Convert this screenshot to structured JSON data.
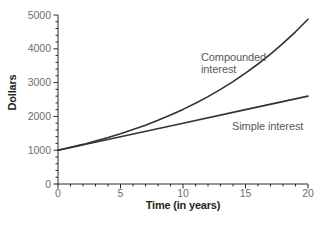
{
  "chart_data": {
    "type": "line",
    "title": "",
    "xlabel": "Time (in years)",
    "ylabel": "Dollars",
    "xlim": [
      0,
      20
    ],
    "ylim": [
      0,
      5000
    ],
    "grid": false,
    "legend_position": "none (inline annotations)",
    "x_axis": {
      "major_ticks": [
        0,
        5,
        10,
        15,
        20
      ],
      "minor_tick_step": 1
    },
    "y_axis": {
      "major_ticks": [
        0,
        1000,
        2000,
        3000,
        4000,
        5000
      ],
      "minor_tick_step": 200
    },
    "series": [
      {
        "name": "Compounded interest",
        "slug": "compounded-interest",
        "x": [
          0,
          1,
          2,
          3,
          4,
          5,
          6,
          7,
          8,
          9,
          10,
          11,
          12,
          13,
          14,
          15,
          16,
          17,
          18,
          19,
          20
        ],
        "values": [
          1000,
          1082,
          1172,
          1268,
          1373,
          1486,
          1608,
          1741,
          1885,
          2040,
          2208,
          2390,
          2587,
          2800,
          3031,
          3281,
          3551,
          3844,
          4161,
          4504,
          4875
        ]
      },
      {
        "name": "Simple interest",
        "slug": "simple-interest",
        "x": [
          0,
          5,
          10,
          15,
          20
        ],
        "values": [
          1000,
          1400,
          1800,
          2200,
          2600
        ]
      }
    ],
    "annotations": [
      {
        "text": "Compounded interest"
      },
      {
        "text": "Simple interest"
      }
    ],
    "colors": {
      "axis": "#2b2a29",
      "curve": "#323232",
      "tick_label": "#6d6e71",
      "axis_label": "#231f20",
      "annotation": "#58595b",
      "background": "#ffffff"
    }
  }
}
